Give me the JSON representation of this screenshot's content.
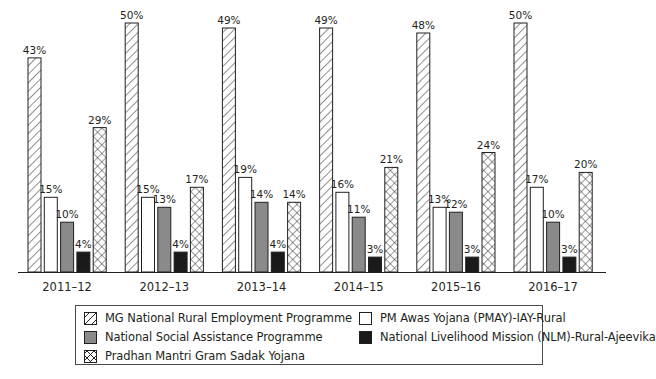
{
  "chart_data": {
    "type": "bar",
    "title": "",
    "xlabel": "",
    "ylabel": "",
    "ylim": [
      0,
      50
    ],
    "grid": false,
    "legend_position": "bottom",
    "categories": [
      "2011–12",
      "2012–13",
      "2013–14",
      "2014–15",
      "2015–16",
      "2016–17"
    ],
    "series": [
      {
        "name": "MG National Rural Employment Programme",
        "pattern": "diagonal-hatch",
        "values": [
          43,
          50,
          49,
          49,
          48,
          50
        ],
        "labels": [
          "43%",
          "50%",
          "49%",
          "49%",
          "48%",
          "50%"
        ]
      },
      {
        "name": "PM Awas Yojana (PMAY)-IAY-Rural",
        "pattern": "white",
        "values": [
          15,
          15,
          19,
          16,
          13,
          17
        ],
        "labels": [
          "15%",
          "15%",
          "19%",
          "16%",
          "13%",
          "17%"
        ]
      },
      {
        "name": "National Social Assistance Programme",
        "pattern": "gray",
        "values": [
          10,
          13,
          14,
          11,
          12,
          10
        ],
        "labels": [
          "10%",
          "13%",
          "14%",
          "11%",
          "12%",
          "10%"
        ]
      },
      {
        "name": "National Livelihood Mission (NLM)-Rural-Ajeevika",
        "pattern": "black",
        "values": [
          4,
          4,
          4,
          3,
          3,
          3
        ],
        "labels": [
          "4%",
          "4%",
          "4%",
          "3%",
          "3%",
          "3%"
        ]
      },
      {
        "name": "Pradhan Mantri Gram Sadak Yojana",
        "pattern": "cross-hatch",
        "values": [
          29,
          17,
          14,
          21,
          24,
          20
        ],
        "labels": [
          "29%",
          "17%",
          "14%",
          "21%",
          "24%",
          "20%"
        ]
      }
    ]
  },
  "legend": {
    "items": [
      {
        "label": "MG National Rural Employment Programme",
        "swatch": "sw-hatch"
      },
      {
        "label": "PM Awas Yojana (PMAY)-IAY-Rural",
        "swatch": "sw-white"
      },
      {
        "label": "National Social Assistance Programme",
        "swatch": "sw-gray"
      },
      {
        "label": "National Livelihood Mission (NLM)-Rural-Ajeevika",
        "swatch": "sw-black"
      },
      {
        "label": "Pradhan Mantri Gram Sadak Yojana",
        "swatch": "sw-cross"
      }
    ]
  },
  "colors": {
    "ink": "#231f20",
    "gray_fill": "#8a8a8a",
    "black_fill": "#1a1a1a",
    "background": "#ffffff"
  }
}
